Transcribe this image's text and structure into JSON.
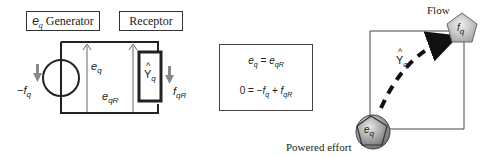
{
  "circuit": {
    "generator_box": {
      "symbol": "e",
      "symbol_sub": "q",
      "label": "Generator"
    },
    "receptor_box": {
      "label": "Receptor"
    },
    "neg_flow": {
      "prefix": "−f",
      "sub": "q"
    },
    "effort": {
      "main": "e",
      "sub": "q"
    },
    "effort_receptor": {
      "main": "e",
      "sub": "qR"
    },
    "admittance": {
      "hat": "^",
      "main": "Y",
      "sub": "q"
    },
    "flow_receptor": {
      "main": "f",
      "sub": "qR"
    }
  },
  "equations": {
    "line1": {
      "lhs": "e",
      "lhs_sub": "q",
      "op": " = ",
      "rhs": "e",
      "rhs_sub": "qR"
    },
    "line2": {
      "lhs": "0",
      "op": " = −",
      "t1": "f",
      "t1_sub": "q",
      "plus": " + ",
      "t2": "f",
      "t2_sub": "qR"
    }
  },
  "graph": {
    "flow_label": "Flow",
    "flow_node": {
      "main": "f",
      "sub": "q"
    },
    "effort_label": "Powered effort",
    "effort_node": {
      "main": "e",
      "sub": "q"
    },
    "edge": {
      "hat": "^",
      "main": "Y",
      "sub": "q"
    },
    "colors": {
      "node_fill": "#c8c8c8",
      "node_stroke": "#555555",
      "effort_circle": "#808080",
      "arrow": "#111111"
    }
  }
}
